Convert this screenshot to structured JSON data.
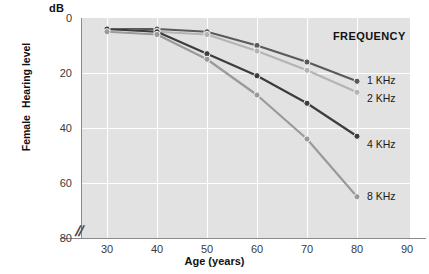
{
  "chart_data": {
    "type": "line",
    "title": "",
    "xlabel": "Age (years)",
    "ylabel": "Female Hearing level",
    "ylabel_lines": [
      "Female",
      "Hearing level"
    ],
    "yunit": "dB",
    "x": [
      30,
      40,
      50,
      60,
      70,
      80
    ],
    "xlim": [
      25,
      90
    ],
    "ylim": [
      0,
      80
    ],
    "y_inverted": true,
    "xticks": [
      30,
      40,
      50,
      60,
      70,
      80,
      90
    ],
    "yticks": [
      0,
      20,
      40,
      60,
      80
    ],
    "grid": true,
    "axis_break_x": true,
    "legend_position": "right-inside",
    "legend_title": "FREQUENCY",
    "series": [
      {
        "name": "1 KHz",
        "color": "#5a5a5a",
        "values": [
          4,
          4,
          5,
          10,
          16,
          23
        ]
      },
      {
        "name": "2 KHz",
        "color": "#b4b4b4",
        "values": [
          4,
          5,
          6,
          12,
          19,
          27
        ]
      },
      {
        "name": "4 KHz",
        "color": "#3c3c3c",
        "values": [
          4,
          5,
          13,
          21,
          31,
          43
        ]
      },
      {
        "name": "8 KHz",
        "color": "#9a9a9a",
        "values": [
          5,
          6,
          15,
          28,
          44,
          65
        ]
      }
    ]
  },
  "axis": {
    "yticks": [
      "0",
      "20",
      "40",
      "60",
      "80"
    ],
    "xticks": [
      "30",
      "40",
      "50",
      "60",
      "70",
      "80",
      "90"
    ],
    "unit_db": "dB",
    "xlabel": "Age (years)",
    "ylabel_top": "Female",
    "ylabel_bottom": "Hearing level",
    "break_symbol": "//"
  },
  "legend": {
    "title": "FREQUENCY",
    "items": [
      {
        "label": "1 KHz"
      },
      {
        "label": "2 KHz"
      },
      {
        "label": "4 KHz"
      },
      {
        "label": "8 KHz"
      }
    ]
  },
  "colors": {
    "plot_background": "#e2e2e2",
    "gridline": "#ffffff",
    "axis": "#8a8a8a",
    "series_1khz": "#5a5a5a",
    "series_2khz": "#b4b4b4",
    "series_4khz": "#3c3c3c",
    "series_8khz": "#9a9a9a"
  }
}
